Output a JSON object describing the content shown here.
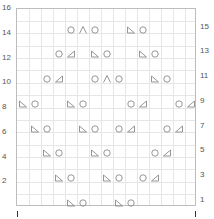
{
  "chart": {
    "columns": 15,
    "rows": 16,
    "left_labels": [
      "16",
      "14",
      "12",
      "10",
      "8",
      "6",
      "4",
      "2"
    ],
    "right_labels": [
      "15",
      "13",
      "11",
      "9",
      "7",
      "5",
      "3",
      "1"
    ],
    "colors": {
      "grid": "#e6e6e6",
      "border": "#bdbdbd",
      "symbol": "#8a8a8a",
      "label": "#555555"
    },
    "legend_symbols": {
      "yo": "circle (yarn over)",
      "k2tog": "right-leaning triangle",
      "ssk": "left-leaning triangle",
      "cdd": "caret (centered double decrease)"
    },
    "cells": [
      {
        "row": 15,
        "col": 5,
        "sym": "yo"
      },
      {
        "row": 15,
        "col": 6,
        "sym": "cdd"
      },
      {
        "row": 15,
        "col": 7,
        "sym": "yo"
      },
      {
        "row": 15,
        "col": 10,
        "sym": "ssk"
      },
      {
        "row": 15,
        "col": 11,
        "sym": "yo"
      },
      {
        "row": 13,
        "col": 4,
        "sym": "yo"
      },
      {
        "row": 13,
        "col": 5,
        "sym": "k2tog"
      },
      {
        "row": 13,
        "col": 7,
        "sym": "ssk"
      },
      {
        "row": 13,
        "col": 8,
        "sym": "yo"
      },
      {
        "row": 13,
        "col": 11,
        "sym": "ssk"
      },
      {
        "row": 13,
        "col": 12,
        "sym": "yo"
      },
      {
        "row": 11,
        "col": 3,
        "sym": "yo"
      },
      {
        "row": 11,
        "col": 4,
        "sym": "k2tog"
      },
      {
        "row": 11,
        "col": 7,
        "sym": "yo"
      },
      {
        "row": 11,
        "col": 8,
        "sym": "cdd"
      },
      {
        "row": 11,
        "col": 9,
        "sym": "yo"
      },
      {
        "row": 11,
        "col": 12,
        "sym": "ssk"
      },
      {
        "row": 11,
        "col": 13,
        "sym": "yo"
      },
      {
        "row": 9,
        "col": 1,
        "sym": "ssk"
      },
      {
        "row": 9,
        "col": 2,
        "sym": "yo"
      },
      {
        "row": 9,
        "col": 5,
        "sym": "ssk"
      },
      {
        "row": 9,
        "col": 6,
        "sym": "yo"
      },
      {
        "row": 9,
        "col": 10,
        "sym": "yo"
      },
      {
        "row": 9,
        "col": 11,
        "sym": "k2tog"
      },
      {
        "row": 9,
        "col": 14,
        "sym": "yo"
      },
      {
        "row": 9,
        "col": 15,
        "sym": "k2tog"
      },
      {
        "row": 7,
        "col": 2,
        "sym": "ssk"
      },
      {
        "row": 7,
        "col": 3,
        "sym": "yo"
      },
      {
        "row": 7,
        "col": 6,
        "sym": "ssk"
      },
      {
        "row": 7,
        "col": 7,
        "sym": "yo"
      },
      {
        "row": 7,
        "col": 9,
        "sym": "yo"
      },
      {
        "row": 7,
        "col": 10,
        "sym": "k2tog"
      },
      {
        "row": 7,
        "col": 13,
        "sym": "yo"
      },
      {
        "row": 7,
        "col": 14,
        "sym": "k2tog"
      },
      {
        "row": 5,
        "col": 3,
        "sym": "ssk"
      },
      {
        "row": 5,
        "col": 4,
        "sym": "yo"
      },
      {
        "row": 5,
        "col": 7,
        "sym": "ssk"
      },
      {
        "row": 5,
        "col": 8,
        "sym": "yo"
      },
      {
        "row": 5,
        "col": 12,
        "sym": "yo"
      },
      {
        "row": 5,
        "col": 13,
        "sym": "k2tog"
      },
      {
        "row": 3,
        "col": 4,
        "sym": "ssk"
      },
      {
        "row": 3,
        "col": 5,
        "sym": "yo"
      },
      {
        "row": 3,
        "col": 8,
        "sym": "ssk"
      },
      {
        "row": 3,
        "col": 9,
        "sym": "yo"
      },
      {
        "row": 3,
        "col": 11,
        "sym": "yo"
      },
      {
        "row": 3,
        "col": 12,
        "sym": "k2tog"
      },
      {
        "row": 1,
        "col": 5,
        "sym": "ssk"
      },
      {
        "row": 1,
        "col": 6,
        "sym": "yo"
      },
      {
        "row": 1,
        "col": 9,
        "sym": "ssk"
      },
      {
        "row": 1,
        "col": 10,
        "sym": "yo"
      }
    ]
  }
}
